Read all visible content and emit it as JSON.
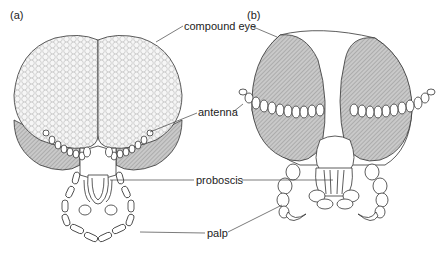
{
  "panels": [
    {
      "id": "a",
      "label": "(a)"
    },
    {
      "id": "b",
      "label": "(b)"
    }
  ],
  "labels": {
    "compound_eye": "compound eye",
    "antenna": "antenna",
    "proboscis": "proboscis",
    "palp": "palp"
  },
  "colors": {
    "line": "#333333",
    "eye_shade": "#b8b8b8",
    "facet_fill": "#f4f4f4"
  }
}
